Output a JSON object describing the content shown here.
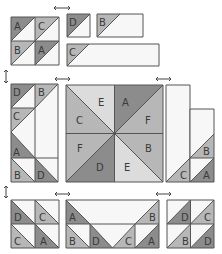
{
  "diagram": {
    "colors": {
      "dark": "#8c8c8c",
      "medium": "#b7b7b7",
      "light": "#dcdcdc",
      "white": "#f7f7f7",
      "outline": "#555555"
    },
    "top_left_block": {
      "labels": [
        "A",
        "C",
        "B",
        "A"
      ]
    },
    "top_right_units": {
      "square_label": "D",
      "short_rect_label": "B",
      "long_rect_label": "C"
    },
    "left_column": {
      "labels": [
        "D",
        "B",
        "C",
        "A",
        "B",
        "D"
      ]
    },
    "center_square": {
      "labels": [
        "E",
        "A",
        "C",
        "F",
        "F",
        "B",
        "D",
        "E"
      ]
    },
    "right_column": {
      "labels": [
        "B",
        "C",
        "A"
      ]
    },
    "bottom_left_block": {
      "labels": [
        "D",
        "C",
        "C",
        "A"
      ]
    },
    "bottom_center_unit": {
      "labels": [
        "A",
        "B",
        "B",
        "D",
        "C",
        "A"
      ]
    },
    "bottom_right_block": {
      "labels": [
        "D",
        "C",
        "B",
        "D"
      ]
    },
    "arrows": [
      "horizontal-top",
      "vertical-left-upper",
      "horizontal-mid-left",
      "horizontal-mid-right",
      "vertical-left-lower",
      "horizontal-bottom-left",
      "horizontal-bottom-right"
    ]
  }
}
